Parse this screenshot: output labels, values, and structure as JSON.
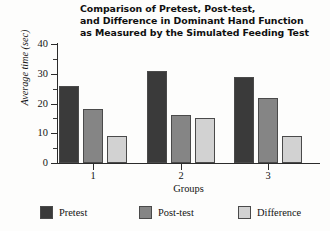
{
  "chart_data": {
    "type": "bar",
    "title": "Comparison of Pretest, Post-test, and Difference in Dominant Hand Function as Measured by the Simulated Feeding Test",
    "title_lines": [
      "Comparison of Pretest, Post-test,",
      "and Difference in Dominant Hand Function",
      "as Measured by the Simulated Feeding Test"
    ],
    "xlabel": "Groups",
    "ylabel": "Average time (sec)",
    "categories": [
      "1",
      "2",
      "3"
    ],
    "ylim": [
      0,
      40
    ],
    "yticks": [
      0,
      10,
      20,
      30,
      40
    ],
    "ytick_labels": [
      "0",
      "10",
      "20",
      "30",
      "40"
    ],
    "yminor_ticks": [
      5,
      15,
      25,
      35
    ],
    "grid": false,
    "legend_position": "bottom",
    "series": [
      {
        "name": "Pretest",
        "color": "#3a3a3a",
        "values": [
          26,
          31,
          29
        ]
      },
      {
        "name": "Post-test",
        "color": "#858585",
        "values": [
          18,
          16,
          22
        ]
      },
      {
        "name": "Difference",
        "color": "#d2d2d2",
        "values": [
          9,
          15,
          9
        ]
      }
    ]
  },
  "legend": {
    "items": [
      {
        "label": "Pretest",
        "color": "#3a3a3a"
      },
      {
        "label": "Post-test",
        "color": "#858585"
      },
      {
        "label": "Difference",
        "color": "#d2d2d2"
      }
    ]
  }
}
